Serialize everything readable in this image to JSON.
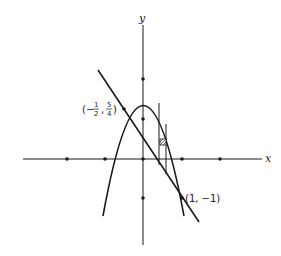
{
  "diagram": {
    "axes": {
      "x_label": "x",
      "y_label": "y"
    },
    "curves": [
      {
        "name": "parabola",
        "equation": "y = 2 - 3x^2",
        "vertex": [
          0,
          2
        ]
      },
      {
        "name": "line",
        "equation": "y = 1/2 - (3/2)x"
      }
    ],
    "intersection_points": [
      {
        "label_prefix": "(−",
        "num1": "1",
        "den1": "2",
        "sep": ",",
        "num2": "5",
        "den2": "4",
        "label_suffix": ")",
        "x": -0.5,
        "y": 1.25
      },
      {
        "label": "(1, −1)",
        "x": 1,
        "y": -1
      }
    ],
    "tick_dots": {
      "x": [
        -2,
        -1,
        0,
        1,
        2
      ],
      "y": [
        -1,
        0,
        1,
        2
      ]
    },
    "strip": {
      "x": 0.5,
      "width": 0.18,
      "marker": "hatched-square"
    },
    "colors": {
      "ink": "#1a1a1a",
      "background": "#ffffff"
    }
  }
}
